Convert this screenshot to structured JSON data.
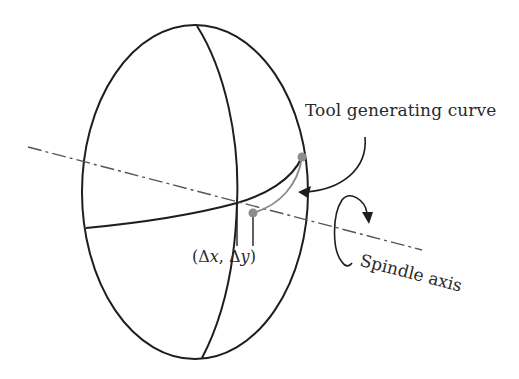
{
  "figure": {
    "type": "3d-schematic",
    "labels": {
      "tool_curve": "Tool generating curve",
      "offset_open": "(",
      "offset_dx_sym": "Δ",
      "offset_dx_var": "x",
      "offset_sep": ", ",
      "offset_dy_sym": "Δ",
      "offset_dy_var": "y",
      "offset_close": ")",
      "spindle_axis": "Spindle axis"
    },
    "colors": {
      "line": "#1e1e1e",
      "axis": "#555555",
      "tool_curve": "#8a8a8a",
      "points": "#8c8c8c",
      "text": "#2a2a2a",
      "background": "#ffffff"
    },
    "shapes": {
      "ellipsoid": {
        "cx": 195,
        "cy": 192,
        "rx": 113,
        "ry": 167
      },
      "points": [
        {
          "name": "tool-curve-start-point",
          "x": 302,
          "y": 157
        },
        {
          "name": "tool-curve-end-point",
          "x": 253,
          "y": 213
        }
      ]
    }
  }
}
